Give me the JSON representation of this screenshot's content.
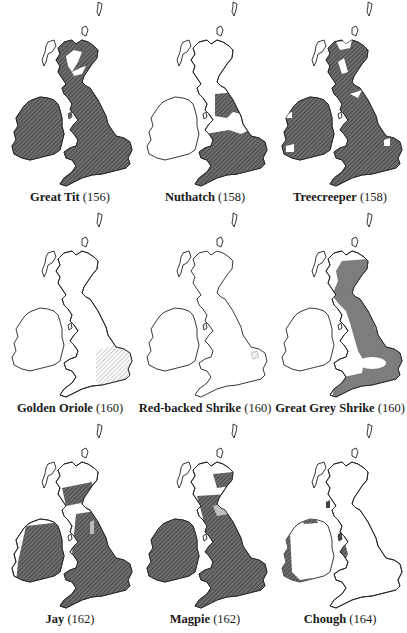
{
  "figure": {
    "type": "distribution-map-grid",
    "region": "British Isles",
    "fill_styles": {
      "hatched": "#5a5a5a",
      "hatched_light": "#9a9a9a",
      "flat_grey": "#7d7d7d",
      "outline": "#222222",
      "background": "#ffffff"
    }
  },
  "maps": [
    {
      "name": "Great Tit",
      "page": "(156)",
      "row": 0,
      "col": 0,
      "range": "almost all of Britain and Ireland except Scottish Highlands and northern isles",
      "fill": "hatched"
    },
    {
      "name": "Nuthatch",
      "page": "(158)",
      "row": 0,
      "col": 1,
      "range": "Wales, southern and central England, northern England west of Pennines",
      "fill": "hatched"
    },
    {
      "name": "Treecreeper",
      "page": "(158)",
      "row": 0,
      "col": 2,
      "range": "almost all of Britain and Ireland with small gaps",
      "fill": "hatched"
    },
    {
      "name": "Golden Oriole",
      "page": "(160)",
      "row": 1,
      "col": 0,
      "range": "East Anglia and south-east England (light hatching)",
      "fill": "hatched_light"
    },
    {
      "name": "Red-backed Shrike",
      "page": "(160)",
      "row": 1,
      "col": 1,
      "range": "small area in East Anglia",
      "fill": "hatched_light"
    },
    {
      "name": "Great Grey Shrike",
      "page": "(160)",
      "row": 1,
      "col": 2,
      "range": "eastern Scotland and eastern/southern England (winter)",
      "fill": "flat_grey"
    },
    {
      "name": "Jay",
      "page": "(162)",
      "row": 2,
      "col": 0,
      "range": "England, Wales, southern Scotland, most of Ireland",
      "fill": "hatched"
    },
    {
      "name": "Magpie",
      "page": "(162)",
      "row": 2,
      "col": 1,
      "range": "Ireland, England, Wales, southern and eastern Scotland",
      "fill": "hatched"
    },
    {
      "name": "Chough",
      "page": "(164)",
      "row": 2,
      "col": 2,
      "range": "western coasts of Ireland, Wales, Isle of Man, Islay",
      "fill": "hatched"
    }
  ]
}
